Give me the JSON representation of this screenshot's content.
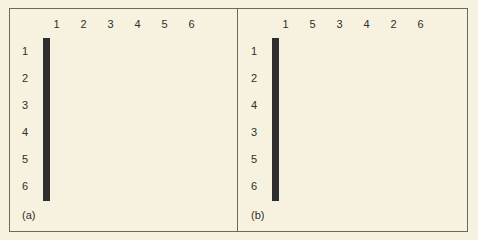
{
  "figure": {
    "panels": [
      {
        "label": "(a)",
        "column_labels": [
          "1",
          "2",
          "3",
          "4",
          "5",
          "6"
        ],
        "row_labels": [
          "1",
          "2",
          "3",
          "4",
          "5",
          "6"
        ],
        "filled_cells": [
          [
            0,
            1
          ],
          [
            1,
            0
          ],
          [
            1,
            4
          ],
          [
            2,
            3
          ],
          [
            3,
            0
          ],
          [
            3,
            4
          ],
          [
            5,
            5
          ]
        ]
      },
      {
        "label": "(b)",
        "column_labels": [
          "1",
          "5",
          "3",
          "4",
          "2",
          "6"
        ],
        "row_labels": [
          "1",
          "2",
          "4",
          "3",
          "5",
          "6"
        ],
        "filled_cells": [
          [
            0,
            4
          ],
          [
            1,
            0
          ],
          [
            1,
            1
          ],
          [
            2,
            0
          ],
          [
            2,
            1
          ],
          [
            3,
            3
          ],
          [
            5,
            5
          ]
        ]
      }
    ],
    "colors": {
      "background": "#f7f2df",
      "cell": "#fbf9f0",
      "filled": "#a3a39f",
      "line": "#2e2e2e"
    }
  }
}
